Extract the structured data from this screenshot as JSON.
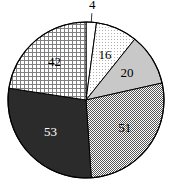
{
  "chart_data": {
    "type": "pie",
    "title": "",
    "subtitle": "",
    "xlabel": "",
    "ylabel": "",
    "legend": "none",
    "grid": false,
    "total": 186,
    "start_angle_deg": 0,
    "direction": "clockwise",
    "categories": [
      "4",
      "16",
      "20",
      "51",
      "53",
      "42"
    ],
    "values": [
      4,
      16,
      20,
      51,
      53,
      42
    ],
    "labels": [
      "4",
      "16",
      "20",
      "51",
      "53",
      "42"
    ],
    "slices": [
      {
        "label": "4",
        "value": 4,
        "percent": "2.2",
        "fill": "#ffffff",
        "pattern": "solid-white",
        "label_position": "outside-top",
        "label_color": "#000000"
      },
      {
        "label": "16",
        "value": 16,
        "percent": "8.6",
        "fill": "#f0f0f0",
        "pattern": "fine-dots-light",
        "label_position": "inside",
        "label_color": "#000000"
      },
      {
        "label": "20",
        "value": 20,
        "percent": "10.8",
        "fill": "#c8c8c8",
        "pattern": "solid-light-gray",
        "label_position": "inside",
        "label_color": "#000000"
      },
      {
        "label": "51",
        "value": 51,
        "percent": "27.4",
        "fill": "#a8a8a8",
        "pattern": "checkerboard-dither",
        "label_position": "inside",
        "label_color": "#000000"
      },
      {
        "label": "53",
        "value": 53,
        "percent": "28.5",
        "fill": "#2b2b2b",
        "pattern": "solid-dark",
        "label_position": "inside",
        "label_color": "#ffffff"
      },
      {
        "label": "42",
        "value": 42,
        "percent": "22.6",
        "fill": "#d8d8d8",
        "pattern": "grid-crosshatch",
        "label_position": "inside",
        "label_color": "#000000"
      }
    ],
    "geometry": {
      "center_x": 86,
      "center_y": 100,
      "radius": 78,
      "outline_color": "#000000"
    }
  }
}
